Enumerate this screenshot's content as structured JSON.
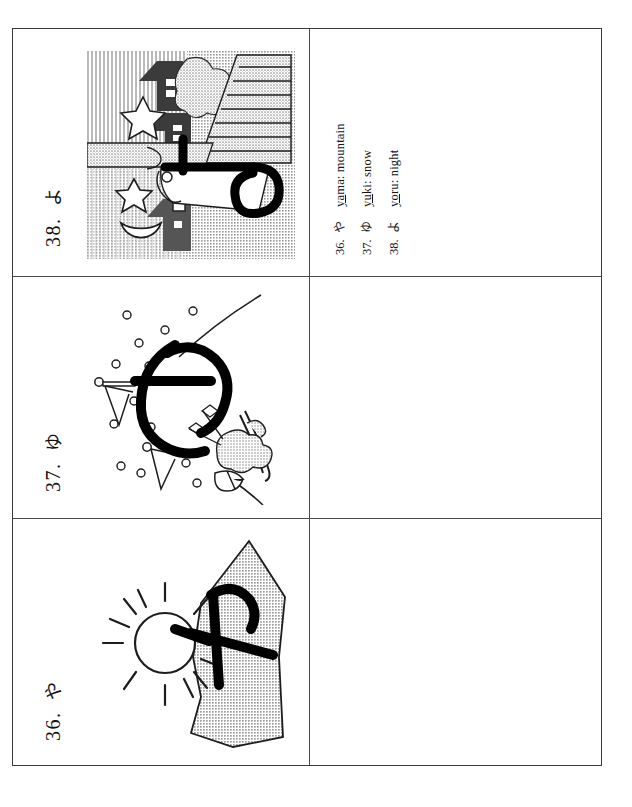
{
  "page": {
    "kind": "flashcard-worksheet",
    "columns": 2,
    "rows": 3
  },
  "cards": [
    {
      "number": "38.",
      "kana": "よ",
      "label_full": "38. よ",
      "illustration": "night-town-scene",
      "illustration_alt": "night scene with houses, stars and crescent moon behind the kana yo"
    },
    {
      "number": "37.",
      "kana": "ゆ",
      "label_full": "37. ゆ",
      "illustration": "skier-snow-scene",
      "illustration_alt": "skier with ski poles amid falling snow forming the kana yu"
    },
    {
      "number": "36.",
      "kana": "や",
      "label_full": "36. や",
      "illustration": "mountain-sun-scene",
      "illustration_alt": "shaded mountain beside a sun forming the kana ya"
    }
  ],
  "answer_key": {
    "entries": [
      {
        "number": "36.",
        "kana": "や",
        "romaji_underlined": "ya",
        "romaji_rest": "ma",
        "separator": ": ",
        "meaning": "mountain",
        "full": "yama: mountain"
      },
      {
        "number": "37.",
        "kana": "ゆ",
        "romaji_underlined": "yu",
        "romaji_rest": "ki",
        "separator": ": ",
        "meaning": "snow",
        "full": "yuki: snow"
      },
      {
        "number": "38.",
        "kana": "よ",
        "romaji_underlined": "yo",
        "romaji_rest": "ru",
        "separator": ": ",
        "meaning": "night",
        "full": "yoru: night"
      }
    ]
  },
  "colors": {
    "paper": "#ffffff",
    "ink": "#111111",
    "rule": "#4a4a4a",
    "border": "#3a3a3a",
    "halftone_gray": "#b4b4b4",
    "halftone_dark": "#555555"
  }
}
